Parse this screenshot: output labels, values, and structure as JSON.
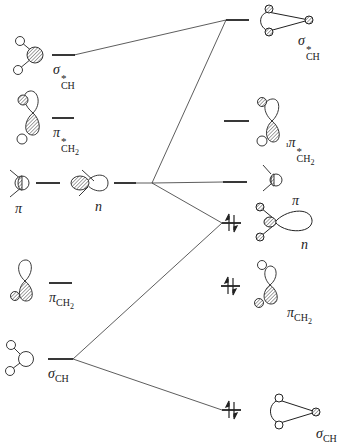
{
  "diagram": {
    "type": "molecular-orbital-interaction-diagram",
    "colors": {
      "ink": "#222222",
      "hatch": "#888888",
      "background": "#ffffff"
    },
    "left_column": {
      "orbitals": [
        {
          "id": "sigma-star-ch",
          "symbol": "σ",
          "superscript": "*",
          "subscript": "CH",
          "occupied": false
        },
        {
          "id": "pi-star-ch2",
          "symbol": "π",
          "superscript": "*",
          "subscript": "CH",
          "subscript2": "2",
          "occupied": false
        },
        {
          "id": "pi",
          "symbol": "π",
          "occupied": false
        },
        {
          "id": "n",
          "symbol": "n",
          "occupied": false
        },
        {
          "id": "pi-ch2",
          "symbol": "π",
          "subscript": "CH",
          "subscript2": "2",
          "occupied": false
        },
        {
          "id": "sigma-ch",
          "symbol": "σ",
          "subscript": "CH",
          "occupied": false
        }
      ]
    },
    "right_column": {
      "orbitals": [
        {
          "id": "sigma-star-ch",
          "symbol": "σ",
          "superscript": "*",
          "subscript": "CH",
          "electrons": 0
        },
        {
          "id": "pi-star-ch2",
          "symbol": "π",
          "superscript": "*",
          "subscript": "CH",
          "subscript2": "2",
          "prefix_mark": "ı",
          "electrons": 0
        },
        {
          "id": "pi",
          "symbol": "π",
          "electrons": 0
        },
        {
          "id": "n",
          "symbol": "n",
          "electrons": 2
        },
        {
          "id": "pi-ch2",
          "symbol": "π",
          "subscript": "CH",
          "subscript2": "2",
          "electrons": 2
        },
        {
          "id": "sigma-ch",
          "symbol": "σ",
          "subscript": "CH",
          "electrons": 2
        }
      ]
    },
    "correlations": [
      {
        "from": "left.sigma-star-ch",
        "to": "right.sigma-star-ch"
      },
      {
        "from": "left.n",
        "to": "right.sigma-star-ch"
      },
      {
        "from": "left.n",
        "to": "right.pi"
      },
      {
        "from": "left.n",
        "to": "right.n"
      },
      {
        "from": "left.sigma-ch",
        "to": "right.n"
      },
      {
        "from": "left.sigma-ch",
        "to": "right.sigma-ch"
      }
    ]
  }
}
